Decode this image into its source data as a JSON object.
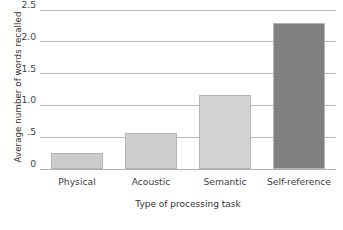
{
  "chart_data": {
    "type": "bar",
    "title": "",
    "subtitle": "",
    "xlabel": "Type of processing task",
    "ylabel": "Average number of words recalled",
    "categories": [
      "Physical",
      "Acoustic",
      "Semantic",
      "Self-reference"
    ],
    "values": [
      0.25,
      0.57,
      1.17,
      2.3
    ],
    "series": [
      {
        "name": "Average number of words recalled",
        "values": [
          0.25,
          0.57,
          1.17,
          2.3
        ]
      }
    ],
    "ylim": [
      0,
      2.5
    ],
    "yticks": [
      0,
      0.5,
      1.0,
      1.5,
      2.0,
      2.5
    ],
    "ytick_labels": [
      "0",
      ".5",
      "1.0",
      "1.5",
      "2.0",
      "2.5"
    ],
    "grid": true,
    "grid_axis": "y",
    "legend": false,
    "legend_position": "none",
    "bar_colors": [
      "#cccccc",
      "#cfcfcf",
      "#d2d2d2",
      "#808080"
    ],
    "bar_edge_color": "#b4b4b4",
    "grid_color": "#b9b9b9",
    "background_color": "#ffffff",
    "text_color": "#3d3d3d"
  }
}
